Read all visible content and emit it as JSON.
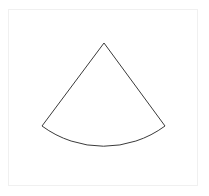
{
  "canvas": {
    "width": 209,
    "height": 196,
    "background_color": "#ffffff"
  },
  "frame": {
    "label": "figure-border",
    "x": 8,
    "y": 9,
    "width": 190,
    "height": 177,
    "border_color": "#f0f0f0",
    "border_width": 1,
    "fill_color": "#ffffff"
  },
  "shape": {
    "name": "circular-sector",
    "description": "Circular sector (pie slice / fan) outline, apex at top, arc bulging downward",
    "stroke_color": "#3a3a3a",
    "stroke_width": 1,
    "fill": "none",
    "apex": {
      "x": 104,
      "y": 43
    },
    "arc_start": {
      "x": 42,
      "y": 126
    },
    "arc_end": {
      "x": 165,
      "y": 126
    },
    "arc_bottom": {
      "x": 104,
      "y": 146
    },
    "radius": 103.6,
    "sweep_direction": "clockwise",
    "path": "M 104 43 L 42 126 A 103.6 103.6 0 0 0 165 126 Z"
  }
}
